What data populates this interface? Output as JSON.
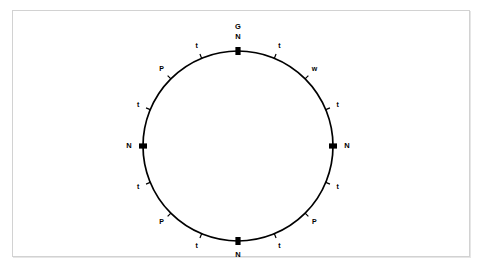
{
  "figure": {
    "title": "",
    "type": "circular-map",
    "background_color": "#ffffff",
    "frame_color": "#d2d2d2",
    "stroke_color": "#000000",
    "center": {
      "x": 238,
      "y": 146
    },
    "radius": 95,
    "origin_marker_label": "G"
  },
  "chart_data": {
    "type": "circular-map",
    "title": "",
    "xlabel": "",
    "ylabel": "",
    "units": "degrees",
    "angle_reference": "0 degrees at top (12 o'clock), clockwise positive",
    "grid": false,
    "legend": null,
    "markers": [
      {
        "label": "N",
        "angle": 0,
        "kind": "major",
        "label_position": "outside"
      },
      {
        "label": "t",
        "angle": 22.5,
        "kind": "minor",
        "label_position": "outside"
      },
      {
        "label": "w",
        "angle": 45,
        "kind": "minor",
        "label_position": "outside"
      },
      {
        "label": "t",
        "angle": 67.5,
        "kind": "minor",
        "label_position": "outside"
      },
      {
        "label": "N",
        "angle": 90,
        "kind": "major",
        "label_position": "outside"
      },
      {
        "label": "t",
        "angle": 112.5,
        "kind": "minor",
        "label_position": "outside"
      },
      {
        "label": "P",
        "angle": 135,
        "kind": "minor",
        "label_position": "outside"
      },
      {
        "label": "t",
        "angle": 157.5,
        "kind": "minor",
        "label_position": "outside"
      },
      {
        "label": "N",
        "angle": 180,
        "kind": "major",
        "label_position": "outside"
      },
      {
        "label": "t",
        "angle": 202.5,
        "kind": "minor",
        "label_position": "outside"
      },
      {
        "label": "P",
        "angle": 225,
        "kind": "minor",
        "label_position": "outside"
      },
      {
        "label": "t",
        "angle": 247.5,
        "kind": "minor",
        "label_position": "outside"
      },
      {
        "label": "N",
        "angle": 270,
        "kind": "major",
        "label_position": "outside"
      },
      {
        "label": "t",
        "angle": 292.5,
        "kind": "minor",
        "label_position": "outside"
      },
      {
        "label": "P",
        "angle": 315,
        "kind": "minor",
        "label_position": "outside"
      },
      {
        "label": "t",
        "angle": 337.5,
        "kind": "minor",
        "label_position": "outside"
      }
    ],
    "origin": {
      "label": "G",
      "angle": 0
    }
  }
}
